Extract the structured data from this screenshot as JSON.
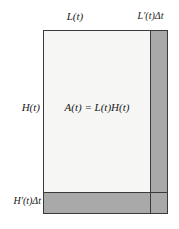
{
  "figure": {
    "type": "geometric-area-diagram",
    "background_color": "#ffffff"
  },
  "labels": {
    "width_main": "L(t)",
    "width_increment": "L′(t)Δt",
    "height_main": "H(t)",
    "height_increment": "H′(t)Δt",
    "area_equation": "A(t) = L(t)H(t)"
  },
  "regions": {
    "main_area": {
      "name": "A(t)",
      "fill_color": "#f6f6f4",
      "width_label": "L(t)",
      "height_label": "H(t)"
    },
    "right_strip": {
      "name": "L'(t)dt strip",
      "fill_color": "#a9a9a9",
      "width_label": "L′(t)Δt"
    },
    "bottom_strip": {
      "name": "H'(t)dt strip",
      "fill_color": "#a9a9a9",
      "height_label": "H′(t)Δt"
    }
  },
  "style": {
    "stroke_color": "#3a3a3a",
    "shade_color": "#a9a9a9",
    "light_fill": "#f6f6f4"
  },
  "chart_data": {
    "type": "diagram",
    "title": "",
    "annotations": [
      {
        "text": "L(t)",
        "position": "top-center",
        "refers_to": "main rectangle width"
      },
      {
        "text": "L′(t)Δt",
        "position": "top-right",
        "refers_to": "right shaded strip width"
      },
      {
        "text": "H(t)",
        "position": "left-middle",
        "refers_to": "main rectangle height"
      },
      {
        "text": "H′(t)Δt",
        "position": "bottom-left",
        "refers_to": "bottom shaded strip height"
      },
      {
        "text": "A(t) = L(t)H(t)",
        "position": "center",
        "refers_to": "area of main rectangle"
      }
    ]
  }
}
